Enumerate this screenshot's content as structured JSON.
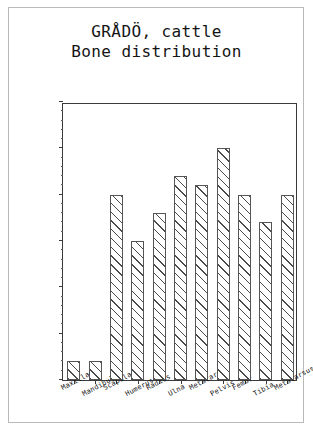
{
  "chart_data": {
    "type": "bar",
    "title": "GRÅDÖ, cattle\nBone distribution",
    "title_lines": [
      "GRÅDÖ, cattle",
      "Bone distribution"
    ],
    "xlabel": "",
    "ylabel": "Minimum number of individuals",
    "categories": [
      "Maxilla",
      "Mandibula",
      "Scapula",
      "Humerus",
      "Radius",
      "Ulna",
      "Metacarpus",
      "Pelvis",
      "Femur",
      "Tibia",
      "Metatarsus"
    ],
    "values": [
      2,
      2,
      20,
      15,
      18,
      22,
      21,
      25,
      20,
      17,
      20
    ],
    "ylim": [
      0,
      30
    ],
    "ytick_labels": [
      "0",
      "5",
      "10",
      "15",
      "20",
      "25",
      "30"
    ],
    "ytick_values": [
      0,
      5,
      10,
      15,
      20,
      25,
      30
    ],
    "yminor_step": 1,
    "grid": false,
    "legend": false,
    "bar_fill": "hatched-diagonal",
    "bar_edge_color": "#555555",
    "axis_color": "#3b3b3b"
  }
}
